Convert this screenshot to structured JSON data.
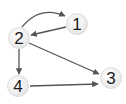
{
  "diagram": {
    "type": "directed-graph",
    "nodes": [
      {
        "id": "1",
        "label": "1",
        "cx": 77,
        "cy": 24
      },
      {
        "id": "2",
        "label": "2",
        "cx": 19,
        "cy": 38
      },
      {
        "id": "3",
        "label": "3",
        "cx": 111,
        "cy": 78
      },
      {
        "id": "4",
        "label": "4",
        "cx": 18,
        "cy": 86
      }
    ],
    "edges": [
      {
        "from": "2",
        "to": "1",
        "style": "curved"
      },
      {
        "from": "1",
        "to": "2",
        "style": "straight"
      },
      {
        "from": "2",
        "to": "4",
        "style": "straight"
      },
      {
        "from": "2",
        "to": "3",
        "style": "straight"
      },
      {
        "from": "4",
        "to": "3",
        "style": "straight"
      }
    ],
    "colors": {
      "edge": "#555555",
      "node_fill": "#f2f2f2",
      "node_stroke": "#d6d6d6",
      "label": "#1a1a1a"
    }
  }
}
